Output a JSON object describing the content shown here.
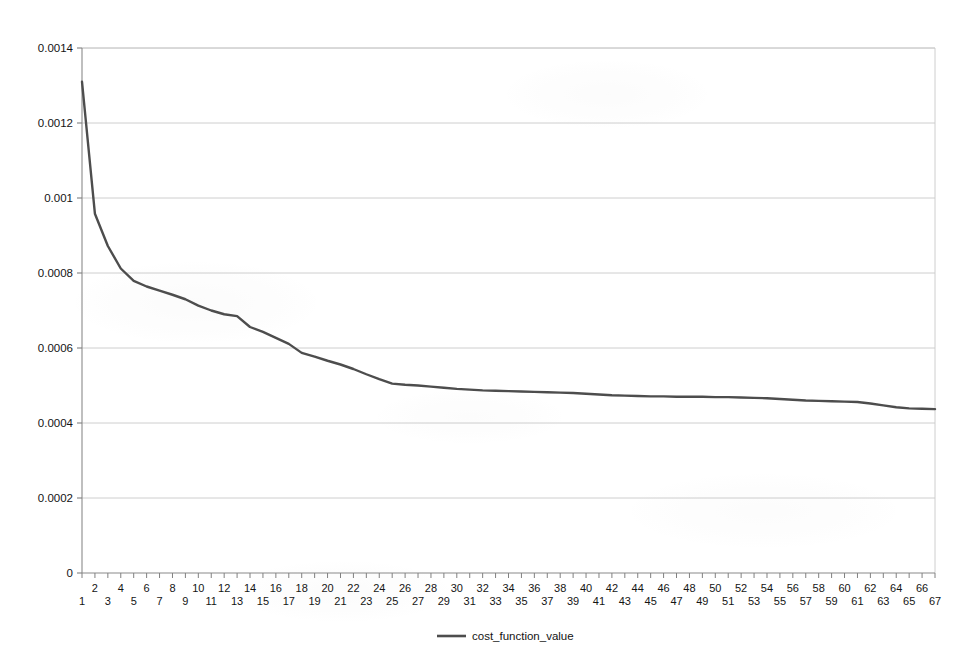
{
  "chart_data": {
    "type": "line",
    "title": "",
    "subtitle": "",
    "xlabel": "",
    "ylabel": "",
    "xlim": [
      1,
      67
    ],
    "ylim": [
      0,
      0.0014
    ],
    "grid": true,
    "grid_axis": "y",
    "legend_position": "bottom-center",
    "legend": [
      "cost_function_value"
    ],
    "series_color": "#4d4d4d",
    "gridline_color": "#c8c8c8",
    "axis_color": "#808080",
    "background_color": "#ffffff",
    "ytick_labels": [
      "0",
      "0.0002",
      "0.0004",
      "0.0006",
      "0.0008",
      "0.001",
      "0.0012",
      "0.0014"
    ],
    "ytick_values": [
      0,
      0.0002,
      0.0004,
      0.0006,
      0.0008,
      0.001,
      0.0012,
      0.0014
    ],
    "xtick_labels": [
      "1",
      "2",
      "3",
      "4",
      "5",
      "6",
      "7",
      "8",
      "9",
      "10",
      "11",
      "12",
      "13",
      "14",
      "15",
      "16",
      "17",
      "18",
      "19",
      "20",
      "21",
      "22",
      "23",
      "24",
      "25",
      "26",
      "27",
      "28",
      "29",
      "30",
      "31",
      "32",
      "33",
      "34",
      "35",
      "36",
      "37",
      "38",
      "39",
      "40",
      "41",
      "42",
      "43",
      "44",
      "45",
      "46",
      "47",
      "48",
      "49",
      "50",
      "51",
      "52",
      "53",
      "54",
      "55",
      "56",
      "57",
      "58",
      "59",
      "60",
      "61",
      "62",
      "63",
      "64",
      "65",
      "66",
      "67"
    ],
    "x": [
      1,
      2,
      3,
      4,
      5,
      6,
      7,
      8,
      9,
      10,
      11,
      12,
      13,
      14,
      15,
      16,
      17,
      18,
      19,
      20,
      21,
      22,
      23,
      24,
      25,
      26,
      27,
      28,
      29,
      30,
      31,
      32,
      33,
      34,
      35,
      36,
      37,
      38,
      39,
      40,
      41,
      42,
      43,
      44,
      45,
      46,
      47,
      48,
      49,
      50,
      51,
      52,
      53,
      54,
      55,
      56,
      57,
      58,
      59,
      60,
      61,
      62,
      63,
      64,
      65,
      66,
      67
    ],
    "series": [
      {
        "name": "cost_function_value",
        "color": "#4d4d4d",
        "values": [
          0.00131,
          0.000958,
          0.000872,
          0.000812,
          0.000779,
          0.000764,
          0.000753,
          0.000742,
          0.00073,
          0.000713,
          0.0007,
          0.00069,
          0.000685,
          0.000656,
          0.000643,
          0.000627,
          0.000611,
          0.000587,
          0.000577,
          0.000566,
          0.000556,
          0.000544,
          0.00053,
          0.000517,
          0.000505,
          0.000502,
          0.0005,
          0.000497,
          0.000494,
          0.000491,
          0.000489,
          0.000487,
          0.000486,
          0.000485,
          0.000484,
          0.000483,
          0.000482,
          0.000481,
          0.00048,
          0.000478,
          0.000476,
          0.000474,
          0.000473,
          0.000472,
          0.000471,
          0.000471,
          0.00047,
          0.00047,
          0.00047,
          0.000469,
          0.000469,
          0.000468,
          0.000467,
          0.000466,
          0.000464,
          0.000462,
          0.00046,
          0.000459,
          0.000458,
          0.000457,
          0.000456,
          0.000452,
          0.000447,
          0.000442,
          0.000439,
          0.000438,
          0.000437
        ]
      }
    ],
    "annotations": []
  },
  "geometry": {
    "plot_left": 82,
    "plot_right": 935,
    "plot_top": 48,
    "plot_bottom": 573,
    "legend_swatch_x1": 437,
    "legend_swatch_x2": 466,
    "legend_text_x": 472,
    "legend_y": 640
  }
}
